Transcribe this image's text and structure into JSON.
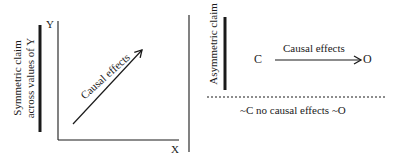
{
  "left_panel": {
    "symmetric_label_line1": "Symmetric claim",
    "symmetric_label_line2": "across values of Y",
    "y_axis_label": "Y",
    "x_axis_label": "X",
    "arrow_label": "Causal effects"
  },
  "right_panel": {
    "asymmetric_label": "Asymmetric claim",
    "cause_label": "C",
    "arrow_label": "Causal effects",
    "outcome_label": "O",
    "negation_label": "~C no causal effects ~O"
  },
  "colors": {
    "ink": "#1a1a1a",
    "background": "#ffffff"
  }
}
